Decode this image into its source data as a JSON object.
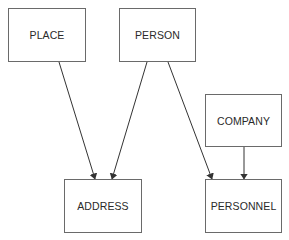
{
  "diagram": {
    "nodes": [
      {
        "id": "place",
        "label": "PLACE",
        "x": 8,
        "y": 8,
        "w": 78,
        "h": 54
      },
      {
        "id": "person",
        "label": "PERSON",
        "x": 119,
        "y": 8,
        "w": 77,
        "h": 54
      },
      {
        "id": "company",
        "label": "COMPANY",
        "x": 205,
        "y": 94,
        "w": 77,
        "h": 53
      },
      {
        "id": "address",
        "label": "ADDRESS",
        "x": 64,
        "y": 179,
        "w": 78,
        "h": 54
      },
      {
        "id": "personnel",
        "label": "PERSONNEL",
        "x": 205,
        "y": 179,
        "w": 77,
        "h": 54
      }
    ],
    "edges": [
      {
        "from": "place",
        "to": "address"
      },
      {
        "from": "person",
        "to": "address"
      },
      {
        "from": "person",
        "to": "personnel"
      },
      {
        "from": "company",
        "to": "personnel"
      }
    ],
    "colors": {
      "line": "#333333",
      "border": "#6a6a6a",
      "text": "#2a2a2a"
    }
  }
}
